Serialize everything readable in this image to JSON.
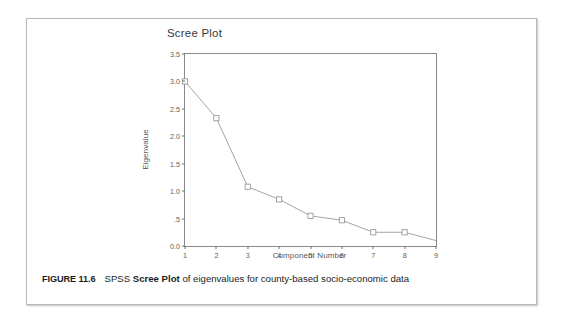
{
  "figure": {
    "label": "FIGURE 11.6",
    "caption_before": "SPSS ",
    "caption_bold": "Scree Plot",
    "caption_after": " of eigenvalues for county-based socio-economic data"
  },
  "chart_data": {
    "type": "line",
    "title": "Scree Plot",
    "xlabel": "Component Number",
    "ylabel": "Eigenvalue",
    "x": [
      1,
      2,
      3,
      4,
      5,
      6,
      7,
      8
    ],
    "values": [
      3.0,
      2.33,
      1.08,
      0.85,
      0.55,
      0.47,
      0.25,
      0.25
    ],
    "xlim": [
      1,
      9
    ],
    "ylim": [
      0.0,
      3.5
    ],
    "xticks": [
      "1",
      "2",
      "3",
      "4",
      "5",
      "6",
      "7",
      "8",
      "9"
    ],
    "xtick_values": [
      1,
      2,
      3,
      4,
      5,
      6,
      7,
      8,
      9
    ],
    "yticks": [
      "3.5",
      "3.0",
      "2.5",
      "2.0",
      "1.5",
      "1.0",
      ".5",
      "0.0"
    ],
    "ytick_values": [
      3.5,
      3.0,
      2.5,
      2.0,
      1.5,
      1.0,
      0.5,
      0.0
    ],
    "grid": false,
    "legend": null,
    "marker": "open-square",
    "line_color": "#9a9a9a",
    "marker_color": "#9a9a9a",
    "axis_color": "#8a8a8a",
    "text_color": "#5d5d5d"
  }
}
